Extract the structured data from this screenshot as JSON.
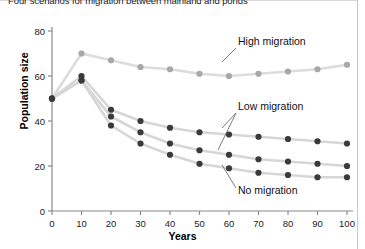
{
  "figure": {
    "title": "Four scenarios for migration between mainland and ponds",
    "xlabel": "Years",
    "ylabel": "Population size"
  },
  "colors": {
    "light_marker": "#a8a8a8",
    "light_line": "#dcdcdc",
    "dark_marker": "#3a3a3a",
    "dark_line": "#d6d6d6",
    "axis": "#8a8a8a",
    "text": "#111111"
  },
  "chart_data": {
    "type": "line",
    "title": "Four scenarios for migration between mainland and ponds",
    "xlabel": "Years",
    "ylabel": "Population size",
    "xlim": [
      0,
      100
    ],
    "ylim": [
      0,
      80
    ],
    "xticks": [
      0,
      10,
      20,
      30,
      40,
      50,
      60,
      70,
      80,
      90,
      100
    ],
    "yticks": [
      0,
      20,
      40,
      60,
      80
    ],
    "grid": false,
    "legend": "annotations",
    "x": [
      0,
      10,
      20,
      30,
      40,
      50,
      60,
      70,
      80,
      90,
      100
    ],
    "series": [
      {
        "name": "High migration",
        "style": "light",
        "values": [
          50,
          70,
          67,
          64,
          63,
          61,
          60,
          61,
          62,
          63,
          65
        ]
      },
      {
        "name": "Low migration (upper)",
        "style": "dark",
        "values": [
          50,
          60,
          45,
          40,
          37,
          35,
          34,
          33,
          32,
          31,
          30
        ]
      },
      {
        "name": "Low migration (lower)",
        "style": "dark",
        "values": [
          50,
          58,
          42,
          35,
          30,
          27,
          25,
          23,
          22,
          21,
          20
        ]
      },
      {
        "name": "No migration",
        "style": "dark",
        "values": [
          50,
          58,
          38,
          30,
          25,
          21,
          19,
          17,
          16,
          15,
          15
        ]
      }
    ],
    "annotations": [
      {
        "text": "High migration",
        "x": 70,
        "y": 73
      },
      {
        "text": "Low migration",
        "x": 70,
        "y": 44
      },
      {
        "text": "No migration",
        "x": 70,
        "y": 10
      }
    ]
  }
}
